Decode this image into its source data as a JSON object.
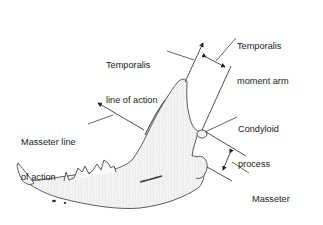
{
  "figure": {
    "labels": {
      "temporalis_line_of_action": [
        "Temporalis",
        "line of action"
      ],
      "temporalis_moment_arm": [
        "Temporalis",
        "moment arm"
      ],
      "masseter_line_of_action": [
        "Masseter line",
        "of action"
      ],
      "condyloid_process": [
        "Condyloid",
        "process"
      ],
      "masseter_moment_arm": [
        "Masseter",
        "moment arm"
      ]
    },
    "colors": {
      "ink": "#222222",
      "bone_fill": "#f4f4f4",
      "stipple": "#8a8a8a"
    }
  }
}
